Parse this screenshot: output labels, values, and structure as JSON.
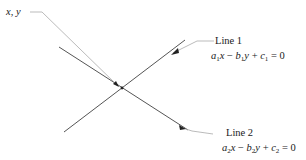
{
  "point_label": "x, y",
  "line1": {
    "name": "Line 1",
    "equation": {
      "a": "a",
      "a_sub": "1",
      "x": "x",
      "minus": " − ",
      "b": "b",
      "b_sub": "1",
      "y": "y",
      "plus": " + ",
      "c": "c",
      "c_sub": "1",
      "rhs": " = 0"
    }
  },
  "line2": {
    "name": "Line 2",
    "equation": {
      "a": "a",
      "a_sub": "2",
      "x": "x",
      "minus": " − ",
      "b": "b",
      "b_sub": "2",
      "y": "y",
      "plus": " + ",
      "c": "c",
      "c_sub": "2",
      "rhs": " = 0"
    }
  },
  "colors": {
    "line": "#444444",
    "leader": "#999999",
    "text": "#1a1a1a"
  }
}
